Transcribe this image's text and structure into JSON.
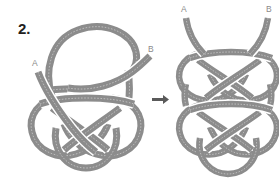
{
  "figure": {
    "step_number": "2.",
    "background_color": "#ffffff",
    "rope_color": "#8c8c8c",
    "rope_edge_color": "#6f6f6f",
    "label_color": "#8a8a8a",
    "number_color": "#231f20",
    "arrow_color": "#5a5a5a",
    "arrow_glyph": "right-arrow",
    "width": 279,
    "height": 183
  },
  "left_diagram": {
    "name": "loop-and-knot-before",
    "labels": {
      "a": "A",
      "b": "B"
    },
    "label_a_position": {
      "x": 32,
      "y": 66
    },
    "label_b_position": {
      "x": 148,
      "y": 52
    }
  },
  "right_diagram": {
    "name": "doubled-knot-after",
    "labels": {
      "a": "A",
      "b": "B"
    },
    "label_a_position": {
      "x": 181,
      "y": 10
    },
    "label_b_position": {
      "x": 266,
      "y": 10
    }
  },
  "transition": {
    "arrow_label": "leads to",
    "arrow_position": {
      "x": 157,
      "y": 98
    }
  }
}
